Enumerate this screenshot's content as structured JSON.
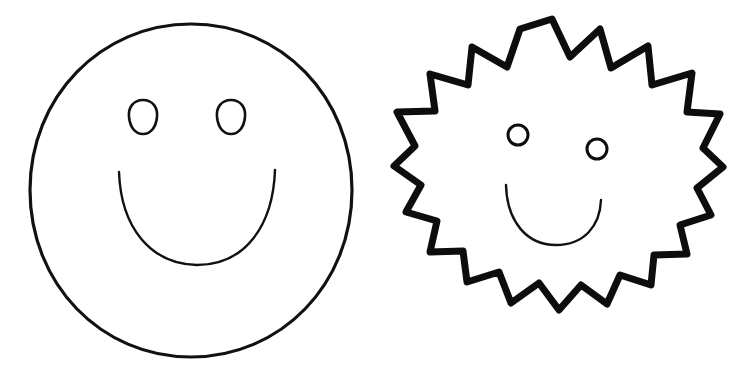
{
  "page": {
    "type": "line-art-drawing",
    "background_color": "#ffffff",
    "ink_color": "#0d0d0d",
    "width": 745,
    "height": 383,
    "figure_count": 2
  },
  "figures": [
    {
      "id": "round-smiley-face",
      "name": "Round Smiley Face",
      "outline_shape": "circle",
      "stroke_color": "#111111",
      "stroke_width": 3.2,
      "fill": "none",
      "bounds": {
        "x": 28,
        "y": 23,
        "width": 325,
        "height": 335
      },
      "outline_path": "M 191 24 C 281 24, 352 97, 352 190 C 352 284, 281 357, 191 357 C 101 357, 30 284, 30 190 C 30 97, 101 24, 191 24 Z",
      "eyes": {
        "name": "egg-shaped-eyes",
        "stroke_width": 2.6,
        "left": {
          "cx": 143,
          "cy": 117,
          "rx": 14,
          "ry": 17,
          "path": "M 143 100 C 153 100, 158 108, 157 117 C 156 127, 151 134, 143 134 C 135 134, 130 127, 129 117 C 128 108, 133 100, 143 100 Z"
        },
        "right": {
          "cx": 231,
          "cy": 117,
          "rx": 14,
          "ry": 17,
          "path": "M 231 100 C 241 100, 246 108, 245 117 C 244 127, 239 134, 231 134 C 223 134, 218 127, 217 117 C 216 108, 221 100, 231 100 Z"
        }
      },
      "mouth": {
        "name": "smile-curve",
        "shape": "u-curve",
        "stroke_width": 2.4,
        "left_end": {
          "x": 119,
          "y": 172
        },
        "right_end": {
          "x": 275,
          "y": 170
        },
        "lowest_point": {
          "x": 197,
          "y": 265
        },
        "path": "M 119 172 C 121 227, 150 264, 197 265 C 245 265, 273 226, 275 170"
      }
    },
    {
      "id": "spiky-smiley-face",
      "name": "Spiky Sunburst Smiley Face",
      "outline_shape": "spiky-star-burst",
      "stroke_color": "#0d0d0d",
      "stroke_width": 7,
      "fill": "none",
      "spike_count": 18,
      "bounds": {
        "x": 385,
        "y": 15,
        "width": 335,
        "height": 335
      },
      "outline_path": "M 552 19 L 570 57 L 600 29 L 611 68 L 648 46 L 652 85 L 692 73 L 687 112 L 720 114 L 703 148 L 723 167 L 697 188 L 711 215 L 680 225 L 687 254 L 654 255 L 651 285 L 620 275 L 607 304 L 581 285 L 559 310 L 539 283 L 511 303 L 499 272 L 467 282 L 463 251 L 430 252 L 437 221 L 406 212 L 421 185 L 394 166 L 415 146 L 397 112 L 435 111 L 430 74 L 468 85 L 472 47 L 507 67 L 520 29 L 552 19 Z",
      "eyes": {
        "name": "round-eyes",
        "stroke_width": 3,
        "left": {
          "cx": 518,
          "cy": 135,
          "r": 10
        },
        "right": {
          "cx": 597,
          "cy": 149,
          "r": 10
        }
      },
      "mouth": {
        "name": "smile-curve",
        "shape": "tilted-u-curve",
        "stroke_width": 2.4,
        "left_end": {
          "x": 506,
          "y": 185
        },
        "right_end": {
          "x": 601,
          "y": 200
        },
        "lowest_point": {
          "x": 556,
          "y": 245
        },
        "path": "M 506 185 C 507 222, 527 245, 556 245 C 584 245, 600 226, 601 200"
      }
    }
  ]
}
